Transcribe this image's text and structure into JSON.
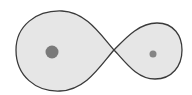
{
  "diagram": {
    "colors": {
      "background": "#ffffff",
      "lobe_fill": "#e6e6e6",
      "outline": "#3a3a3a",
      "primary_mass": "#7a7a7a",
      "secondary_mass": "#858585"
    },
    "lagrange_point": {
      "x": 114,
      "y": 50
    },
    "lobes": [
      {
        "name": "primary-lobe",
        "left": 16,
        "top": 11,
        "bottom": 91,
        "right": 114
      },
      {
        "name": "secondary-lobe",
        "left": 114,
        "top": 23,
        "bottom": 79,
        "right": 182
      }
    ],
    "masses": [
      {
        "name": "primary-mass",
        "cx": 52,
        "cy": 52,
        "r": 6.5
      },
      {
        "name": "secondary-mass",
        "cx": 153,
        "cy": 54,
        "r": 3.5
      }
    ]
  }
}
